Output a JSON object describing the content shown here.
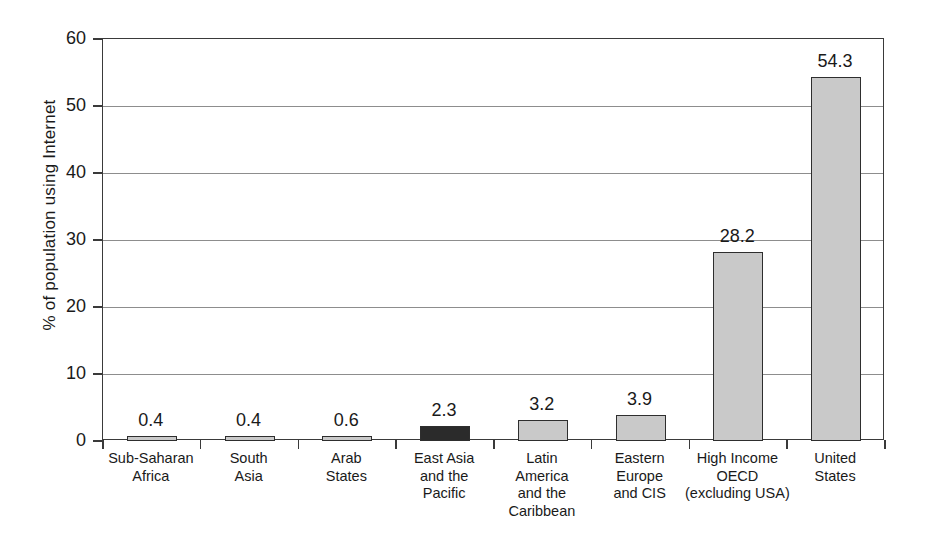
{
  "chart_data": {
    "type": "bar",
    "title": "",
    "subtitle": "",
    "xlabel": "",
    "ylabel": "% of population using Internet",
    "ylim": [
      0,
      60
    ],
    "ytick_values": [
      0,
      10,
      20,
      30,
      40,
      50,
      60
    ],
    "ytick_labels": [
      "0",
      "10",
      "20",
      "30",
      "40",
      "50",
      "60"
    ],
    "grid": "horizontal",
    "legend": "none",
    "categories": [
      "Sub-Saharan\nAfrica",
      "South\nAsia",
      "Arab\nStates",
      "East Asia\nand the\nPacific",
      "Latin\nAmerica\nand the\nCaribbean",
      "Eastern\nEurope\nand CIS",
      "High Income\nOECD\n(excluding USA)",
      "United\nStates"
    ],
    "values": [
      0.4,
      0.4,
      0.6,
      2.3,
      3.2,
      3.9,
      28.2,
      54.3
    ],
    "value_labels": [
      "0.4",
      "0.4",
      "0.6",
      "2.3",
      "3.2",
      "3.9",
      "28.2",
      "54.3"
    ],
    "bar_colors": [
      "#c9c9c9",
      "#c9c9c9",
      "#c9c9c9",
      "#2b2b2b",
      "#c9c9c9",
      "#c9c9c9",
      "#c9c9c9",
      "#c9c9c9"
    ],
    "bar_edge_color": "#2e2e2e",
    "gridline_color": "#8d8d8d",
    "axis_color": "#3a3a3a",
    "background_color": "#ffffff"
  }
}
